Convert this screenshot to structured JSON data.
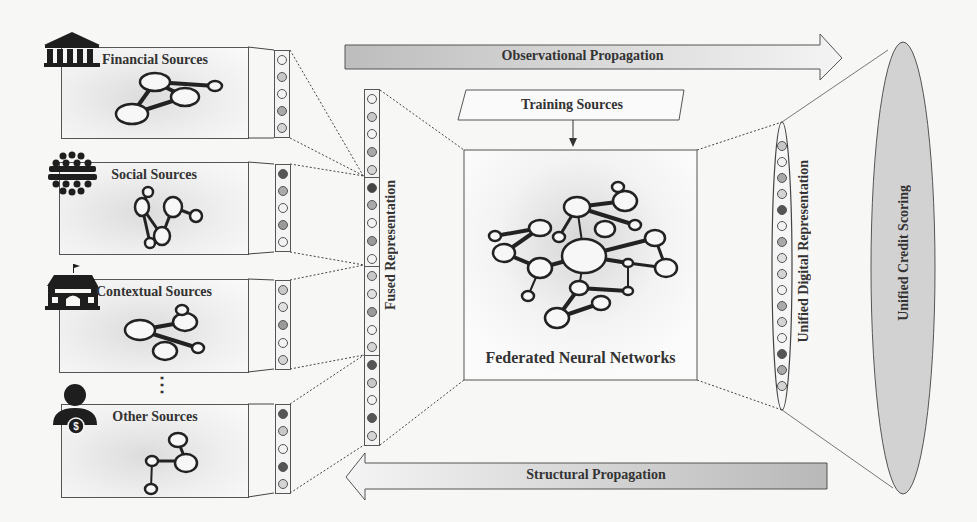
{
  "sources": [
    {
      "label": "Financial Sources",
      "icon": "bank-icon",
      "vector": [
        "#f2f2f2",
        "#c8c8c8",
        "#f2f2f2",
        "#a8a8a8",
        "#d4d4d4"
      ]
    },
    {
      "label": "Social Sources",
      "icon": "crowd-icon",
      "vector": [
        "#555555",
        "#aaaaaa",
        "#f2f2f2",
        "#999999",
        "#f2f2f2"
      ]
    },
    {
      "label": "Contextual Sources",
      "icon": "school-icon",
      "vector": [
        "#c8c8c8",
        "#e0e0e0",
        "#999999",
        "#f2f2f2",
        "#d4d4d4"
      ]
    },
    {
      "label": "Other Sources",
      "icon": "person-dollar-icon",
      "vector": [
        "#555555",
        "#c8c8c8",
        "#f2f2f2",
        "#555555",
        "#d4d4d4"
      ]
    }
  ],
  "ellipsis": "⋮",
  "fused": {
    "label": "Fused Representation",
    "vector": [
      "#f2f2f2",
      "#c8c8c8",
      "#f2f2f2",
      "#a8a8a8",
      "#d4d4d4",
      "#444444",
      "#aaaaaa",
      "#f2f2f2",
      "#999999",
      "#f2f2f2",
      "#c8c8c8",
      "#e0e0e0",
      "#999999",
      "#f2f2f2",
      "#d4d4d4",
      "#555555",
      "#c8c8c8",
      "#f2f2f2",
      "#555555",
      "#d4d4d4"
    ]
  },
  "arrows": {
    "top": "Observational Propagation",
    "bottom": "Structural Propagation"
  },
  "training": {
    "label": "Training Sources"
  },
  "federated": {
    "label": "Federated Neural Networks"
  },
  "unified_digital": {
    "label": "Unified Digital Representation",
    "vector": [
      "#c8c8c8",
      "#f2f2f2",
      "#a8a8a8",
      "#d4d4d4",
      "#555555",
      "#f2f2f2",
      "#a8a8a8",
      "#e0e0e0",
      "#d4d4d4",
      "#f2f2f2",
      "#aaaaaa",
      "#d4d4d4",
      "#f2f2f2",
      "#555555",
      "#a8a8a8",
      "#d4d4d4"
    ]
  },
  "credit": {
    "label": "Unified Credit Scoring"
  }
}
